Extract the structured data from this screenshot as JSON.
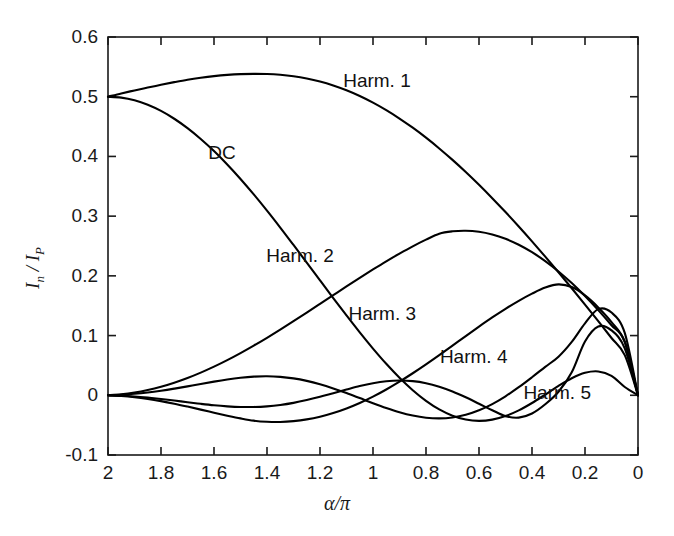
{
  "figure": {
    "background": "#ffffff",
    "line_color": "#000000"
  },
  "chart_data": {
    "type": "line",
    "title": "",
    "xlabel": "α/π",
    "ylabel": "I_n / I_P",
    "ylabel_parts": {
      "base1": "I",
      "sub1": "n",
      "slash": " / ",
      "base2": "I",
      "sub2": "P"
    },
    "xlim": [
      2,
      0
    ],
    "ylim": [
      -0.1,
      0.6
    ],
    "x_reversed": true,
    "grid": false,
    "legend": "inline-annotations",
    "xticks": [
      2,
      1.8,
      1.6,
      1.4,
      1.2,
      1,
      0.8,
      0.6,
      0.4,
      0.2,
      0
    ],
    "xtick_labels": [
      "2",
      "1.8",
      "1.6",
      "1.4",
      "1.2",
      "1",
      "0.8",
      "0.6",
      "0.4",
      "0.2",
      "0"
    ],
    "yticks": [
      -0.1,
      0,
      0.1,
      0.2,
      0.3,
      0.4,
      0.5,
      0.6
    ],
    "ytick_labels": [
      "-0.1",
      "0",
      "0.1",
      "0.2",
      "0.3",
      "0.4",
      "0.5",
      "0.6"
    ],
    "x": [
      2,
      1.95,
      1.9,
      1.85,
      1.8,
      1.75,
      1.7,
      1.65,
      1.6,
      1.55,
      1.5,
      1.45,
      1.4,
      1.35,
      1.3,
      1.25,
      1.2,
      1.15,
      1.1,
      1.05,
      1,
      0.95,
      0.9,
      0.85,
      0.8,
      0.75,
      0.7,
      0.65,
      0.6,
      0.55,
      0.5,
      0.45,
      0.4,
      0.35,
      0.3,
      0.25,
      0.2,
      0.15,
      0.1,
      0.05,
      0
    ],
    "series": [
      {
        "name": "DC",
        "label": "DC",
        "label_x": 1.57,
        "label_y": 0.405,
        "values": [
          0.5,
          0.4985,
          0.494,
          0.4865,
          0.4762,
          0.4631,
          0.4474,
          0.4293,
          0.409,
          0.3865,
          0.3623,
          0.3364,
          0.3092,
          0.2809,
          0.2517,
          0.2222,
          0.1924,
          0.1628,
          0.1337,
          0.1053,
          0.0782,
          0.0527,
          0.0293,
          0.0085,
          -0.0093,
          -0.0237,
          -0.0342,
          -0.0406,
          -0.0428,
          -0.0408,
          -0.0348,
          -0.0253,
          -0.0129,
          0.0013,
          0.0157,
          0.0286,
          0.0376,
          0.0399,
          0.0325,
          0.0139,
          0
        ]
      },
      {
        "name": "Harm. 1",
        "label": "Harm. 1",
        "label_x": 0.985,
        "label_y": 0.5265,
        "values": [
          0.5,
          0.5055,
          0.5105,
          0.5153,
          0.5199,
          0.5244,
          0.5285,
          0.5318,
          0.5345,
          0.5365,
          0.5378,
          0.5383,
          0.538,
          0.5367,
          0.5343,
          0.5306,
          0.5255,
          0.5189,
          0.5108,
          0.5012,
          0.4901,
          0.4775,
          0.4635,
          0.4481,
          0.4314,
          0.4134,
          0.3942,
          0.3739,
          0.3525,
          0.3301,
          0.3068,
          0.2827,
          0.2578,
          0.2322,
          0.206,
          0.1792,
          0.1519,
          0.1241,
          0.0959,
          0.0673,
          0
        ]
      },
      {
        "name": "Harm. 2",
        "label": "Harm. 2",
        "label_x": 1.275,
        "label_y": 0.2335,
        "values": [
          0,
          0.0016,
          0.0045,
          0.0088,
          0.0143,
          0.0211,
          0.029,
          0.038,
          0.048,
          0.0589,
          0.0707,
          0.0832,
          0.0963,
          0.11,
          0.1241,
          0.1385,
          0.1531,
          0.1677,
          0.1823,
          0.1967,
          0.2107,
          0.2243,
          0.2372,
          0.2494,
          0.2606,
          0.2707,
          0.2746,
          0.2756,
          0.2738,
          0.2692,
          0.262,
          0.2521,
          0.2396,
          0.2247,
          0.2074,
          0.1879,
          0.1662,
          0.1426,
          0.1172,
          0.0901,
          0
        ]
      },
      {
        "name": "Harm. 3",
        "label": "Harm. 3",
        "label_x": 0.965,
        "label_y": 0.1355,
        "values": [
          0,
          -0.0012,
          -0.0032,
          -0.0061,
          -0.0098,
          -0.0141,
          -0.0189,
          -0.024,
          -0.0291,
          -0.0341,
          -0.0387,
          -0.0425,
          -0.0444,
          -0.0447,
          -0.0433,
          -0.0404,
          -0.0359,
          -0.0298,
          -0.0221,
          -0.0129,
          -0.0023,
          0.0097,
          0.0228,
          0.0369,
          0.0518,
          0.0673,
          0.0832,
          0.0992,
          0.115,
          0.1303,
          0.1448,
          0.1582,
          0.1702,
          0.1804,
          0.1857,
          0.1812,
          0.1672,
          0.1472,
          0.1226,
          0.0889,
          0
        ]
      },
      {
        "name": "Harm. 4",
        "label": "Harm. 4",
        "label_x": 0.62,
        "label_y": 0.0645,
        "values": [
          0,
          0.0009,
          0.0025,
          0.0048,
          0.0077,
          0.0111,
          0.0149,
          0.0189,
          0.0229,
          0.0265,
          0.0294,
          0.0313,
          0.0319,
          0.0309,
          0.0283,
          0.0241,
          0.0184,
          0.0115,
          0.0037,
          -0.0047,
          -0.0132,
          -0.0212,
          -0.0283,
          -0.0339,
          -0.0375,
          -0.0387,
          -0.0371,
          -0.0326,
          -0.0251,
          -0.0147,
          -0.0017,
          0.0135,
          0.0302,
          0.0476,
          0.0646,
          0.0894,
          0.1205,
          0.1443,
          0.1385,
          0.1045,
          0
        ]
      },
      {
        "name": "Harm. 5",
        "label": "Harm. 5",
        "label_x": 0.305,
        "label_y": 0.0045,
        "values": [
          0,
          -0.0007,
          -0.002,
          -0.0039,
          -0.0062,
          -0.0088,
          -0.0116,
          -0.0143,
          -0.0167,
          -0.0185,
          -0.0196,
          -0.0196,
          -0.0185,
          -0.0162,
          -0.0127,
          -0.008,
          -0.0025,
          0.0036,
          0.0097,
          0.0155,
          0.0202,
          0.0234,
          0.0247,
          0.0237,
          0.0203,
          0.0144,
          0.0064,
          -0.0033,
          -0.0141,
          -0.025,
          -0.0349,
          -0.0374,
          -0.0305,
          -0.0151,
          0.0059,
          0.0386,
          0.0901,
          0.1152,
          0.1088,
          0.0786,
          0
        ]
      }
    ]
  }
}
